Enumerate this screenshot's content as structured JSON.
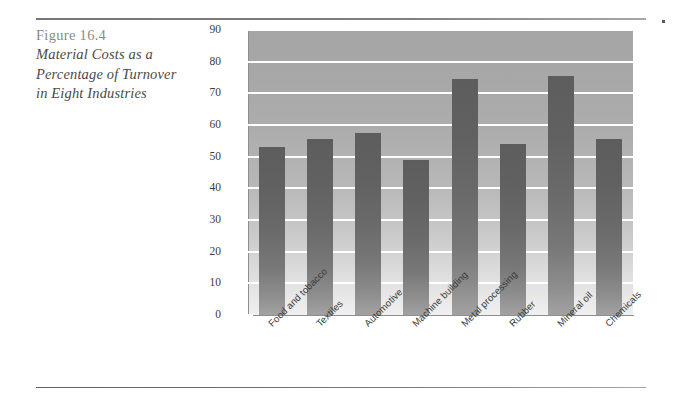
{
  "figure": {
    "number_label": "Figure 16.4",
    "title_line_1": "Material Costs as a",
    "title_line_2": "Percentage of Turnover",
    "title_line_3": "in Eight Industries"
  },
  "colors": {
    "plot_background_top": "#a5a5a5",
    "plot_background_bottom": "#f0f0f0",
    "bar_top": "#5d5d5d",
    "bar_bottom": "#a2a2a2",
    "gridline": "#ffffff",
    "axis": "#8e8e8e",
    "rule": "#7a7a7a",
    "caption_number": "#8a8a8a",
    "caption_title": "#4a4a4a"
  },
  "chart_data": {
    "type": "bar",
    "title": "Material Costs as a Percentage of Turnover in Eight Industries",
    "xlabel": "",
    "ylabel": "",
    "ylim": [
      0,
      90
    ],
    "ytick_step": 10,
    "yticks": [
      0,
      10,
      20,
      30,
      40,
      50,
      60,
      70,
      80,
      90
    ],
    "ytick_labels": [
      "0",
      "10",
      "20",
      "30",
      "40",
      "50",
      "60",
      "70",
      "80",
      "90"
    ],
    "grid": true,
    "grid_axis": "y",
    "legend": false,
    "xtick_label_rotation": -45,
    "categories": [
      "Food and tobacco",
      "Textiles",
      "Automotive",
      "Machine building",
      "Metal processing",
      "Rubber",
      "Mineral oil",
      "Chemicals"
    ],
    "values": [
      53,
      55.5,
      57.5,
      49,
      74.5,
      54,
      75.5,
      55.5
    ]
  }
}
